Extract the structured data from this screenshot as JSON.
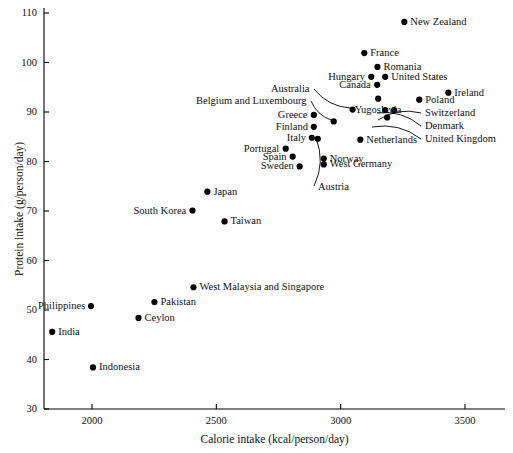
{
  "chart_data": {
    "type": "scatter",
    "title": "",
    "xlabel": "Calorie intake (kcal/person/day)",
    "ylabel": "Protein intake (g/person/day)",
    "xlim": [
      1800,
      3700
    ],
    "ylim": [
      30,
      112
    ],
    "xticks": [
      2000,
      2500,
      3000,
      3500
    ],
    "yticks": [
      30,
      40,
      50,
      60,
      70,
      80,
      90,
      100,
      110
    ],
    "grid": false,
    "legend": null,
    "point_color": "#000000",
    "axis_color": "#000000",
    "points": [
      {
        "name": "New Zealand",
        "x": 3256,
        "y": 108.2,
        "label_side": "right"
      },
      {
        "name": "France",
        "x": 3095,
        "y": 101.9,
        "label_side": "right"
      },
      {
        "name": "Romania",
        "x": 3148,
        "y": 99.1,
        "label_side": "right"
      },
      {
        "name": "Hungary",
        "x": 3123,
        "y": 97.1,
        "label_side": "left"
      },
      {
        "name": "United States",
        "x": 3179,
        "y": 97.1,
        "label_side": "right"
      },
      {
        "name": "Canada",
        "x": 3147,
        "y": 95.5,
        "label_side": "left"
      },
      {
        "name": "Ireland",
        "x": 3433,
        "y": 93.9,
        "label_side": "right"
      },
      {
        "name": "Poland",
        "x": 3316,
        "y": 92.5,
        "label_side": "right"
      },
      {
        "name": "Australia",
        "x": 3048,
        "y": 90.5,
        "label_side": "leader"
      },
      {
        "name": "Yugoslavia",
        "x": 3151,
        "y": 92.7,
        "label_side": "below"
      },
      {
        "name": "Belgium and Luxembourg",
        "x": 2972,
        "y": 88.1,
        "label_side": "leader"
      },
      {
        "name": "Greece",
        "x": 2892,
        "y": 89.4,
        "label_side": "left"
      },
      {
        "name": "Switzerland",
        "x": 3179,
        "y": 90.4,
        "label_side": "leader"
      },
      {
        "name": "Denmark",
        "x": 3215,
        "y": 90.4,
        "label_side": "leader"
      },
      {
        "name": "United Kingdom",
        "x": 3187,
        "y": 88.9,
        "label_side": "leader"
      },
      {
        "name": "Finland",
        "x": 2892,
        "y": 87.0,
        "label_side": "left"
      },
      {
        "name": "Italy",
        "x": 2884,
        "y": 84.8,
        "label_side": "left"
      },
      {
        "name": "Netherlands",
        "x": 3079,
        "y": 84.4,
        "label_side": "right"
      },
      {
        "name": "Portugal",
        "x": 2779,
        "y": 82.6,
        "label_side": "left"
      },
      {
        "name": "Spain",
        "x": 2807,
        "y": 81.0,
        "label_side": "left"
      },
      {
        "name": "Norway",
        "x": 2932,
        "y": 80.6,
        "label_side": "right"
      },
      {
        "name": "West Germany",
        "x": 2932,
        "y": 79.4,
        "label_side": "right"
      },
      {
        "name": "Sweden",
        "x": 2835,
        "y": 79.0,
        "label_side": "left"
      },
      {
        "name": "Austria",
        "x": 2908,
        "y": 84.6,
        "label_side": "leader"
      },
      {
        "name": "Japan",
        "x": 2464,
        "y": 73.9,
        "label_side": "right"
      },
      {
        "name": "South Korea",
        "x": 2404,
        "y": 70.1,
        "label_side": "left"
      },
      {
        "name": "Taiwan",
        "x": 2533,
        "y": 67.9,
        "label_side": "right"
      },
      {
        "name": "West Malaysia and Singapore",
        "x": 2408,
        "y": 54.6,
        "label_side": "right"
      },
      {
        "name": "Pakistan",
        "x": 2251,
        "y": 51.6,
        "label_side": "right"
      },
      {
        "name": "Philippines",
        "x": 1996,
        "y": 50.8,
        "label_side": "left"
      },
      {
        "name": "Ceylon",
        "x": 2187,
        "y": 48.4,
        "label_side": "right"
      },
      {
        "name": "India",
        "x": 1840,
        "y": 45.6,
        "label_side": "right"
      },
      {
        "name": "Indonesia",
        "x": 2004,
        "y": 38.4,
        "label_side": "right"
      }
    ],
    "leader_lines": [
      {
        "name": "Australia",
        "from_label": [
          314,
          89
        ],
        "to_point": [
          350,
          108
        ]
      },
      {
        "name": "Belgium and Luxembourg",
        "from_label": [
          311,
          101
        ],
        "to_point": [
          331,
          120
        ]
      },
      {
        "name": "Switzerland",
        "from_label": [
          421,
          113
        ],
        "to_point": [
          378,
          120
        ]
      },
      {
        "name": "Denmark",
        "from_label": [
          421,
          126
        ],
        "to_point": [
          377,
          113
        ]
      },
      {
        "name": "United Kingdom",
        "from_label": [
          421,
          139
        ],
        "to_point": [
          372,
          127
        ]
      },
      {
        "name": "Austria",
        "from_label": [
          314,
          186
        ],
        "to_point": [
          316,
          138
        ]
      }
    ]
  },
  "axis": {
    "x_tick_labels": [
      "2000",
      "2500",
      "3000",
      "3500"
    ],
    "y_tick_labels": [
      "110",
      "100",
      "90",
      "80",
      "70",
      "60",
      "50",
      "40",
      "30"
    ],
    "x_title": "Calorie intake (kcal/person/day)",
    "y_title": "Protein intake (g/person/day)"
  }
}
